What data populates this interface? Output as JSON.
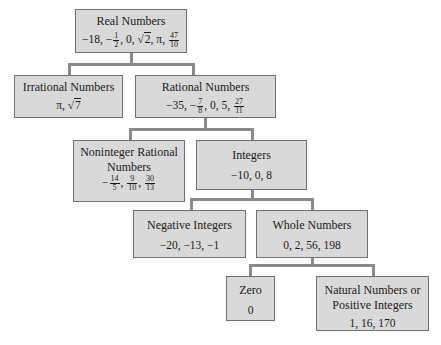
{
  "diagram": {
    "type": "tree",
    "nodes": {
      "real": {
        "title": "Real Numbers",
        "values_text": "−18, −1/2, 0, √2, π, 47/10",
        "parts": {
          "a": "−18, −",
          "f1n": "1",
          "f1d": "2",
          "b": ", 0, ",
          "sq": "2",
          "c": ", π, ",
          "f2n": "47",
          "f2d": "10"
        }
      },
      "irrational": {
        "title": "Irrational Numbers",
        "values_text": "π, √7",
        "parts": {
          "a": "π, ",
          "sq": "7"
        }
      },
      "rational": {
        "title": "Rational Numbers",
        "values_text": "−35, −7/8, 0, 5, 27/11",
        "parts": {
          "a": "−35, −",
          "f1n": "7",
          "f1d": "8",
          "b": ", 0, 5, ",
          "f2n": "27",
          "f2d": "11"
        }
      },
      "noninteger": {
        "title_line1": "Noninteger Rational",
        "title_line2": "Numbers",
        "values_text": "−14/5, 9/10, 30/13",
        "parts": {
          "a": "−",
          "f1n": "14",
          "f1d": "5",
          "s1": ", ",
          "f2n": "9",
          "f2d": "10",
          "s2": ", ",
          "f3n": "30",
          "f3d": "13"
        }
      },
      "integers": {
        "title": "Integers",
        "values": "−10, 0, 8"
      },
      "negative": {
        "title": "Negative Integers",
        "values": "−20, −13, −1"
      },
      "whole": {
        "title": "Whole Numbers",
        "values": "0, 2, 56, 198"
      },
      "zero": {
        "title": "Zero",
        "values": "0"
      },
      "natural": {
        "title_line1": "Natural Numbers or",
        "title_line2": "Positive Integers",
        "values": "1, 16, 170"
      }
    },
    "edges": [
      [
        "real",
        "irrational"
      ],
      [
        "real",
        "rational"
      ],
      [
        "rational",
        "noninteger"
      ],
      [
        "rational",
        "integers"
      ],
      [
        "integers",
        "negative"
      ],
      [
        "integers",
        "whole"
      ],
      [
        "whole",
        "zero"
      ],
      [
        "whole",
        "natural"
      ]
    ],
    "colors": {
      "box_fill": "#d9d9d9",
      "box_border": "#6f6f6f",
      "connector": "#8a8a8a"
    }
  }
}
